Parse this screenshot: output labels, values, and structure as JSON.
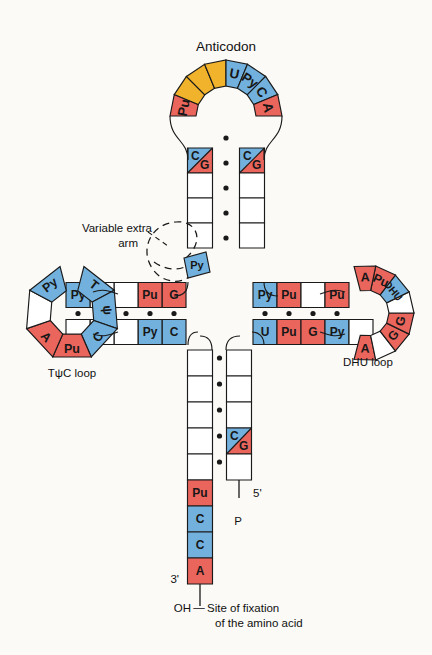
{
  "figure": {
    "title_label": "Anticodon",
    "variable_arm_label_line1": "Variable extra",
    "variable_arm_label_line2": "arm",
    "tpsic_loop_label": "TψC loop",
    "dhu_loop_label": "DHU loop",
    "five_prime_label": "5'",
    "three_prime_label": "3'",
    "phosphate_label": "P",
    "oh_label": "OH",
    "dash_label": "—",
    "fixation_line1": "Site of fixation",
    "fixation_line2": "of the amino acid"
  },
  "colors": {
    "red": "#ea655c",
    "blue": "#72b1dd",
    "yellow": "#f2b32c",
    "white": "#ffffff",
    "outline": "#1a1a1a",
    "background": "#fbfaf7",
    "text": "#111111"
  },
  "anticodon_loop": {
    "name": "anticodon-loop",
    "cells": [
      {
        "label": "Pu",
        "color": "red"
      },
      {
        "label": "",
        "color": "yellow"
      },
      {
        "label": "",
        "color": "yellow"
      },
      {
        "label": "",
        "color": "yellow"
      },
      {
        "label": "U",
        "color": "blue"
      },
      {
        "label": "Py",
        "color": "blue"
      },
      {
        "label": "C",
        "color": "blue"
      },
      {
        "label": "A",
        "color": "red"
      }
    ]
  },
  "anticodon_stem": {
    "name": "anticodon-stem",
    "left_cells": [
      {
        "label": "C",
        "color": "blue",
        "split": "G",
        "split_color": "red"
      },
      {
        "label": "",
        "color": "white"
      },
      {
        "label": "",
        "color": "white"
      },
      {
        "label": "",
        "color": "white"
      }
    ],
    "right_cells": [
      {
        "label": "C",
        "color": "blue",
        "split": "G",
        "split_color": "red"
      },
      {
        "label": "",
        "color": "white"
      },
      {
        "label": "",
        "color": "white"
      },
      {
        "label": "",
        "color": "white"
      }
    ],
    "bond_count": 4
  },
  "tpsic_arm": {
    "name": "tpsic-arm",
    "loop_cells": [
      {
        "label": "T",
        "color": "blue"
      },
      {
        "label": "ψ",
        "color": "blue"
      },
      {
        "label": "C",
        "color": "blue"
      },
      {
        "label": "Pu",
        "color": "red"
      },
      {
        "label": "A",
        "color": "red"
      },
      {
        "label": "",
        "color": "white"
      },
      {
        "label": "Py",
        "color": "blue"
      }
    ],
    "top_stem": [
      {
        "label": "G",
        "color": "red"
      },
      {
        "label": "Pu",
        "color": "red"
      },
      {
        "label": "",
        "color": "white"
      },
      {
        "label": "",
        "color": "white"
      },
      {
        "label": "Py",
        "color": "blue"
      }
    ],
    "bottom_stem": [
      {
        "label": "C",
        "color": "blue"
      },
      {
        "label": "Py",
        "color": "blue"
      },
      {
        "label": "",
        "color": "white"
      },
      {
        "label": "",
        "color": "white"
      },
      {
        "label": "",
        "color": "white"
      }
    ],
    "bond_count": 5
  },
  "dhu_arm": {
    "name": "dhu-arm",
    "loop_cells": [
      {
        "label": "A",
        "color": "red"
      },
      {
        "label": "",
        "color": "white"
      },
      {
        "label": "G",
        "color": "red"
      },
      {
        "label": "G",
        "color": "red"
      },
      {
        "label": "",
        "color": "white"
      },
      {
        "label": "DHU",
        "color": "blue"
      },
      {
        "label": "Pu",
        "color": "red"
      },
      {
        "label": "A",
        "color": "red"
      }
    ],
    "top_stem": [
      {
        "label": "Py",
        "color": "blue"
      },
      {
        "label": "Pu",
        "color": "red"
      },
      {
        "label": "",
        "color": "white"
      },
      {
        "label": "Pu",
        "color": "red"
      }
    ],
    "bottom_stem": [
      {
        "label": "U",
        "color": "blue"
      },
      {
        "label": "Pu",
        "color": "red"
      },
      {
        "label": "G",
        "color": "red"
      },
      {
        "label": "Py",
        "color": "blue"
      },
      {
        "label": "",
        "color": "white"
      }
    ],
    "bond_count": 4
  },
  "acceptor_stem": {
    "name": "acceptor-stem",
    "five_prime_cells": [
      {
        "label": "",
        "color": "white"
      },
      {
        "label": "",
        "color": "white"
      },
      {
        "label": "",
        "color": "white"
      },
      {
        "label": "C",
        "color": "blue",
        "split": "G",
        "split_color": "red"
      },
      {
        "label": "",
        "color": "white"
      }
    ],
    "three_prime_cells": [
      {
        "label": "",
        "color": "white"
      },
      {
        "label": "",
        "color": "white"
      },
      {
        "label": "",
        "color": "white"
      },
      {
        "label": "",
        "color": "white"
      },
      {
        "label": "",
        "color": "white"
      }
    ],
    "tail_cells": [
      {
        "label": "Pu",
        "color": "red"
      },
      {
        "label": "C",
        "color": "blue"
      },
      {
        "label": "C",
        "color": "blue"
      },
      {
        "label": "A",
        "color": "red"
      }
    ],
    "bond_count": 4
  }
}
